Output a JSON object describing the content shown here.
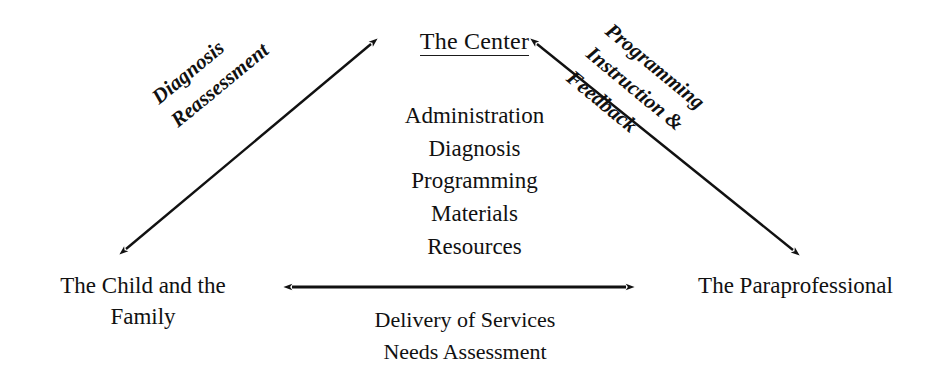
{
  "diagram": {
    "background_color": "#ffffff",
    "ink_color": "#111111",
    "nodes": {
      "center": {
        "label": "The Center",
        "underlined": true,
        "functions_heading": "",
        "functions": [
          "Administration",
          "Diagnosis",
          "Programming",
          "Materials",
          "Resources"
        ]
      },
      "child_family": {
        "line1": "The Child and the",
        "line2": "Family"
      },
      "paraprofessional": {
        "line1": "The Paraprofessional"
      }
    },
    "edges": {
      "left": {
        "from": "The Child and the Family",
        "to": "The Center",
        "arrowheads": "both",
        "line1": "Diagnosis",
        "line2": "Reassessment",
        "rotation_deg": -39.5
      },
      "right": {
        "from": "The Center",
        "to": "The Paraprofessional",
        "arrowheads": "both",
        "line1": "Programming",
        "line2": "Instruction &",
        "line3": "Feedback",
        "rotation_deg": 39.5
      },
      "bottom": {
        "from": "The Child and the Family",
        "to": "The Paraprofessional",
        "arrowheads": "both",
        "line1": "Delivery of Services",
        "line2": "Needs Assessment",
        "rotation_deg": 0
      }
    }
  }
}
